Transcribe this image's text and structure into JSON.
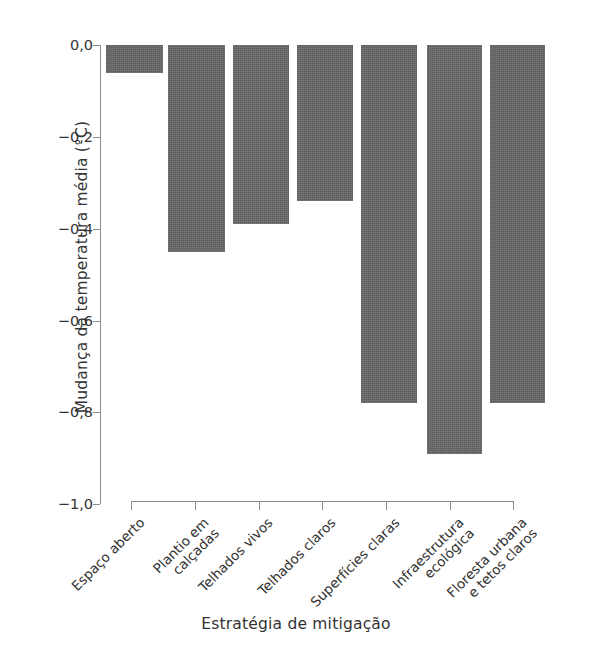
{
  "chart_data": {
    "type": "bar",
    "title": "",
    "xlabel": "Estratégia de mitigação",
    "ylabel": "Mudança da temperatura média (°C)",
    "ylim": [
      -1.0,
      0.0
    ],
    "ytick_labels": [
      "0,0",
      "−0,2",
      "−0,4",
      "−0,6",
      "−0,8",
      "−1,0"
    ],
    "ytick_values": [
      0.0,
      -0.2,
      -0.4,
      -0.6,
      -0.8,
      -1.0
    ],
    "grid": false,
    "legend": "none",
    "bar_color": "#666666",
    "axis_color": "#8d8d8d",
    "categories": [
      "Espaço aberto",
      "Plantio em calçadas",
      "Telhados vivos",
      "Telhados claros",
      "Superfícies claras",
      "Infraestrutura ecológica",
      "Floresta urbana e tetos claros"
    ],
    "category_lines": [
      [
        "Espaço aberto"
      ],
      [
        "Plantio em",
        "calçadas"
      ],
      [
        "Telhados vivos"
      ],
      [
        "Telhados claros"
      ],
      [
        "Superfícies claras"
      ],
      [
        "Infraestrutura",
        "ecológica"
      ],
      [
        "Floresta urbana",
        "e tetos claros"
      ]
    ],
    "values": [
      -0.06,
      -0.45,
      -0.39,
      -0.34,
      -0.78,
      -0.89,
      -0.78
    ]
  }
}
